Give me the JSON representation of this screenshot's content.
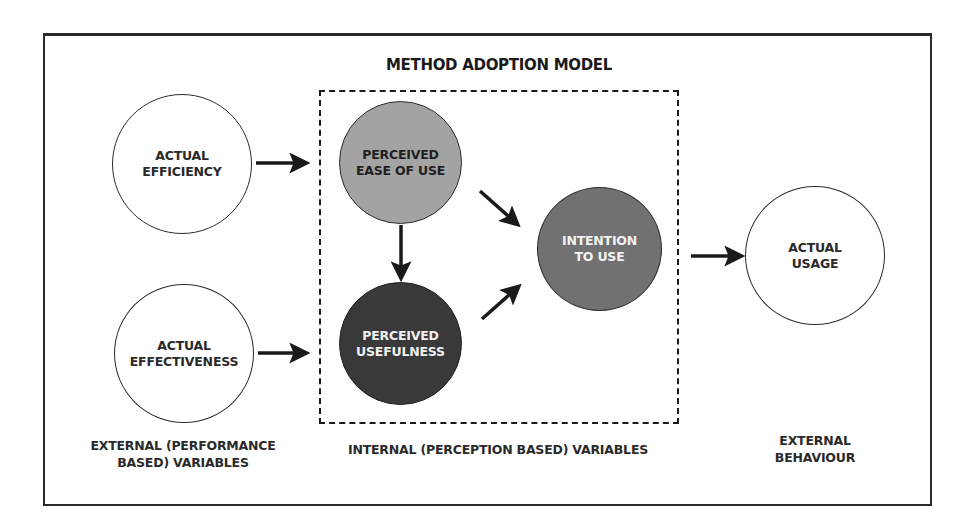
{
  "diagram": {
    "title": "METHOD ADOPTION MODEL",
    "nodes": {
      "actual_efficiency": {
        "label": "ACTUAL\nEFFICIENCY",
        "fill": "#ffffff"
      },
      "actual_effectiveness": {
        "label": "ACTUAL\nEFFECTIVENESS",
        "fill": "#ffffff"
      },
      "perceived_ease_of_use": {
        "label": "PERCEIVED\nEASE OF USE",
        "fill": "#a3a3a3"
      },
      "perceived_usefulness": {
        "label": "PERCEIVED\nUSEFULNESS",
        "fill": "#393939"
      },
      "intention_to_use": {
        "label": "INTENTION\nTO USE",
        "fill": "#717171"
      },
      "actual_usage": {
        "label": "ACTUAL\nUSAGE",
        "fill": "#ffffff"
      }
    },
    "edges": [
      {
        "from": "ACTUAL EFFICIENCY",
        "to": "PERCEIVED EASE OF USE"
      },
      {
        "from": "ACTUAL EFFECTIVENESS",
        "to": "PERCEIVED USEFULNESS"
      },
      {
        "from": "PERCEIVED EASE OF USE",
        "to": "PERCEIVED USEFULNESS"
      },
      {
        "from": "PERCEIVED EASE OF USE",
        "to": "INTENTION TO USE"
      },
      {
        "from": "PERCEIVED USEFULNESS",
        "to": "INTENTION TO USE"
      },
      {
        "from": "INTENTION TO USE",
        "to": "ACTUAL USAGE"
      }
    ],
    "captions": {
      "external_performance": "EXTERNAL (PERFORMANCE\nBASED) VARIABLES",
      "internal_perception": "INTERNAL (PERCEPTION BASED) VARIABLES",
      "external_behaviour": "EXTERNAL\nBEHAVIOUR"
    }
  }
}
